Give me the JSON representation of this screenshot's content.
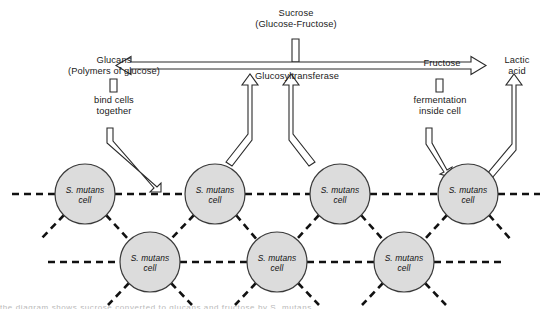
{
  "diagram": {
    "title_node": {
      "line1": "Sucrose",
      "line2": "(Glucose-Fructose)"
    },
    "left_node": {
      "line1": "Glucans",
      "line2": "(Polymers of glucose)"
    },
    "left_process": {
      "line1": "bind cells",
      "line2": "together"
    },
    "center_enzyme": "Glucosyltransferase",
    "right_node": "Fructose",
    "right_process": {
      "line1": "fermentation",
      "line2": "inside cell"
    },
    "far_right_node": {
      "line1": "Lactic",
      "line2": "acid"
    },
    "cell_label": {
      "line1": "S. mutans",
      "line2": "cell"
    },
    "cells_top": [
      {
        "id": "cell-top-1",
        "cx": 85,
        "cy": 194
      },
      {
        "id": "cell-top-2",
        "cx": 215,
        "cy": 194
      },
      {
        "id": "cell-top-3",
        "cx": 340,
        "cy": 194
      },
      {
        "id": "cell-top-4",
        "cx": 468,
        "cy": 194
      }
    ],
    "cells_bottom": [
      {
        "id": "cell-bottom-1",
        "cx": 150,
        "cy": 262
      },
      {
        "id": "cell-bottom-2",
        "cx": 277,
        "cy": 262
      },
      {
        "id": "cell-bottom-3",
        "cx": 404,
        "cy": 262
      }
    ],
    "cell_radius": 30,
    "colors": {
      "cell_fill": "#dcdcdc",
      "cell_stroke": "#3a3a3a",
      "arrow_stroke": "#2b2b2b",
      "arrow_fill": "#ffffff",
      "dash_color": "#111111",
      "text": "#1a1a1a"
    },
    "footer_clipped_text": "the diagram shows sucrose converted to glucans and fructose by S. mutans"
  }
}
